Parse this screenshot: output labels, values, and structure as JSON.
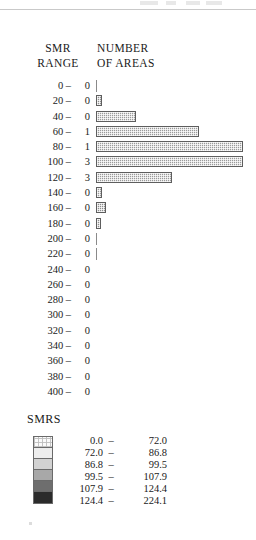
{
  "headings": {
    "smr": "SMR",
    "range": "RANGE",
    "number": "NUMBER",
    "of_areas": "OF AREAS"
  },
  "legend": {
    "title": "SMRS",
    "dash": "–",
    "classes": [
      {
        "low": "0.0",
        "high": "72.0",
        "color": "#fbfbfb"
      },
      {
        "low": "72.0",
        "high": "86.8",
        "color": "#ededed"
      },
      {
        "low": "86.8",
        "high": "99.5",
        "color": "#d2d2d2"
      },
      {
        "low": "99.5",
        "high": "107.9",
        "color": "#a8a8a8"
      },
      {
        "low": "107.9",
        "high": "124.4",
        "color": "#6e6e6e"
      },
      {
        "low": "124.4",
        "high": "224.1",
        "color": "#2b2b2b"
      }
    ]
  },
  "chart_data": {
    "type": "bar",
    "orientation": "horizontal",
    "title": "",
    "xlabel": "NUMBER OF AREAS",
    "ylabel": "SMR RANGE",
    "grid": false,
    "legend_position": "bottom-left",
    "categories": [
      "0",
      "20",
      "40",
      "60",
      "80",
      "100",
      "120",
      "140",
      "160",
      "180",
      "200",
      "220",
      "240",
      "260",
      "280",
      "300",
      "320",
      "340",
      "360",
      "380",
      "400"
    ],
    "category_suffix": " –",
    "count_labels": [
      0,
      0,
      0,
      1,
      1,
      3,
      3,
      0,
      0,
      0,
      0,
      0,
      0,
      0,
      0,
      0,
      0,
      0,
      0,
      0,
      0
    ],
    "values": [
      1,
      6,
      40,
      103,
      147,
      147,
      76,
      6,
      10,
      5,
      1,
      1,
      0,
      0,
      0,
      0,
      0,
      0,
      0,
      0,
      0
    ],
    "bar_styles": [
      "hairline",
      "solid",
      "hatched",
      "hatched",
      "hatched",
      "hatched",
      "hatched",
      "hatched",
      "solid",
      "solid",
      "hairline",
      "hairline",
      "none",
      "none",
      "none",
      "none",
      "none",
      "none",
      "none",
      "none",
      "none"
    ],
    "xlim": [
      0,
      160
    ],
    "value_units": "px-length"
  }
}
